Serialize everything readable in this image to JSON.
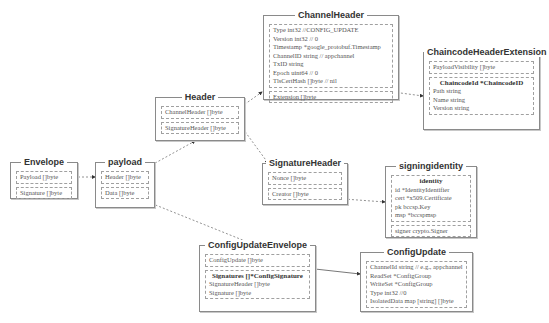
{
  "boxes": {
    "envelope": {
      "title": "Envelope",
      "fields": [
        "Payload []byte",
        "Signature []byte"
      ]
    },
    "payload": {
      "title": "payload",
      "fields": [
        "Header []byte",
        "Data []byte"
      ]
    },
    "header": {
      "title": "Header",
      "fields": [
        "ChannelHeader []byte",
        "SignatureHeader []byte"
      ]
    },
    "channel_header": {
      "title": "ChannelHeader",
      "group_lines": [
        "Type int32 //CONFIG_UPDATE",
        "Version int32 // 0",
        "Timestamp *google_protobuf.Timestamp",
        "ChannelID string // appchannel",
        "TxID string",
        "Epoch uint64 // 0",
        "TlsCertHash []byte // nil"
      ],
      "extension": "Extension []byte"
    },
    "chaincode_header_extension": {
      "title": "ChaincodeHeaderExtension",
      "payload_visibility": "PayloadVisibility []byte",
      "chaincode_id_title": "ChaincodeId *ChaincodeID",
      "chaincode_id_lines": [
        "Path string",
        "Name string",
        "Version string"
      ]
    },
    "signature_header": {
      "title": "SignatureHeader",
      "fields": [
        "Nonce []byte",
        "Creator []byte"
      ]
    },
    "signing_identity": {
      "title": "signingidentity",
      "identity_title": "identity",
      "identity_lines": [
        "id *IdentityIdentifier",
        "cert *x509.Certificate",
        "pk bccsp.Key",
        "msp *bccspmsp"
      ],
      "signer": "signer crypto.Signer"
    },
    "config_update_envelope": {
      "title": "ConfigUpdateEnvelope",
      "config_update": "ConfigUpdate []byte",
      "signatures_title": "Signatures []*ConfigSignature",
      "signatures_lines": [
        "SignatureHeader []byte",
        "Signature []byte"
      ]
    },
    "config_update": {
      "title": "ConfigUpdate",
      "lines": [
        "ChannelId string // e.g., appchannel",
        "ReadSet *ConfigGroup",
        "WriteSet *ConfigGroup",
        "Type int32 //0",
        "IsolatedData map [string] []byte"
      ]
    }
  },
  "colors": {
    "border": "#8a8a8a",
    "edge": "#666666",
    "text": "#555555"
  }
}
